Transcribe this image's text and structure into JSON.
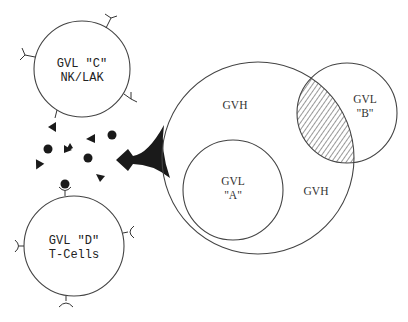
{
  "diagram": {
    "colors": {
      "ink": "#1a1a1a",
      "line": "#444444",
      "background": "#ffffff"
    },
    "cell_c": {
      "line1": "GVL \"C\"",
      "line2": "NK/LAK",
      "receptor_type": "fork"
    },
    "cell_d": {
      "line1": "GVL \"D\"",
      "line2": "T-Cells",
      "receptor_type": "cup"
    },
    "big_circle": {
      "label_top": "GVH",
      "label_right": "GVH"
    },
    "circle_a": {
      "line1": "GVL",
      "line2": "\"A\""
    },
    "circle_b": {
      "line1": "GVL",
      "line2": "\"B\"",
      "overlap_pattern": "hatched"
    },
    "soluble_factors": {
      "dots": 5,
      "triangles": 6
    },
    "connector": {
      "shape": "diamond-funnel"
    }
  }
}
